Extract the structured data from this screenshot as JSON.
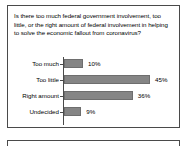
{
  "panel": {
    "question": "Is there too much federal government involvement, too little, or the right amount of federal involvement in helping to solve the economic fallout from coronavirus?"
  },
  "chart_data": {
    "type": "bar",
    "orientation": "horizontal",
    "title": "Is there too much federal government involvement, too little, or the right amount of federal involvement in helping to solve the economic fallout from coronavirus?",
    "categories": [
      "Too much",
      "Too little",
      "Right amount",
      "Undecided"
    ],
    "values": [
      10,
      45,
      36,
      9
    ],
    "value_labels": [
      "10%",
      "45%",
      "36%",
      "9%"
    ],
    "xlabel": "",
    "ylabel": "",
    "xlim": [
      0,
      45
    ],
    "grid": false,
    "legend": false,
    "bar_color": "#858585",
    "bar_border_color": "#6e6e6e",
    "axis_color": "#4a4a4a",
    "text_color": "#000000"
  }
}
